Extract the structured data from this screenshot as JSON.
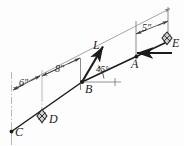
{
  "figure": {
    "background_color": "#fdfdfd",
    "line_color": "#1b1b1b",
    "dim_line_color": "#8c8c8c",
    "marker_fill": "#cfcfcf",
    "points": [
      {
        "id": "C",
        "label": "C",
        "x": 12,
        "y": 131,
        "label_x": 15,
        "label_y": 133
      },
      {
        "id": "D",
        "label": "D",
        "x": 42,
        "y": 116,
        "label_x": 48,
        "label_y": 120
      },
      {
        "id": "B",
        "label": "B",
        "x": 82,
        "y": 82,
        "label_x": 85,
        "label_y": 89
      },
      {
        "id": "A",
        "label": "A",
        "x": 136,
        "y": 57,
        "label_x": 133,
        "label_y": 63
      },
      {
        "id": "E",
        "label": "E",
        "x": 168,
        "y": 42,
        "label_x": 172,
        "label_y": 43
      },
      {
        "id": "L",
        "label": "L",
        "x": 98,
        "y": 51,
        "label_x": 94,
        "label_y": 46
      }
    ],
    "dimensions": [
      {
        "id": "dim-6in",
        "label": "6\"",
        "label_x": 22,
        "label_y": 84,
        "from": "C",
        "to": "D"
      },
      {
        "id": "dim-8in",
        "label": "8\"",
        "label_x": 57,
        "label_y": 72,
        "label_note": "D to B"
      },
      {
        "id": "dim-5in",
        "label": "5\"",
        "label_x": 142,
        "label_y": 29,
        "label_note": "A to E"
      },
      {
        "id": "dim-L",
        "label": "L",
        "label_x": 94,
        "label_y": 46,
        "label_note": "overall length C to E"
      }
    ],
    "angles": [
      {
        "id": "angle-45",
        "label": "45°",
        "label_x": 95,
        "label_y": 70,
        "vertex": "B"
      }
    ],
    "supports": [
      {
        "id": "support-D",
        "type": "pin-support",
        "x": 42,
        "y": 116
      },
      {
        "id": "support-E",
        "type": "pin-support",
        "x": 168,
        "y": 38
      }
    ],
    "forces": [
      {
        "id": "force-at-B",
        "direction": "up-right-45deg",
        "from_x": 82,
        "from_y": 82,
        "to_x": 104,
        "to_y": 46
      },
      {
        "id": "force-at-E",
        "direction": "horizontal-left",
        "from_x": 170,
        "from_y": 53,
        "to_x": 136,
        "to_y": 53
      }
    ]
  }
}
